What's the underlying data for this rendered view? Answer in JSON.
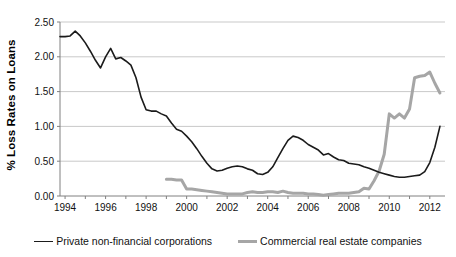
{
  "chart_data": {
    "type": "line",
    "title": "",
    "xlabel": "",
    "ylabel": "% Loss Rates on Loans",
    "xlim": [
      1993.75,
      2012.75
    ],
    "ylim": [
      0.0,
      2.5
    ],
    "grid": true,
    "grid_axis": "y",
    "legend_position": "bottom",
    "xticks": [
      1994,
      1996,
      1998,
      2000,
      2002,
      2004,
      2006,
      2008,
      2010,
      2012
    ],
    "xtick_labels": [
      "1994",
      "1996",
      "1998",
      "2000",
      "2002",
      "2004",
      "2006",
      "2008",
      "2010",
      "2012"
    ],
    "yticks": [
      0.0,
      0.5,
      1.0,
      1.5,
      2.0,
      2.5
    ],
    "ytick_labels": [
      "0.00",
      "0.50",
      "1.00",
      "1.50",
      "2.00",
      "2.50"
    ],
    "series": [
      {
        "name": "Private non-financial corporations",
        "color": "#1b1b1b",
        "width": 1.6,
        "x": [
          1993.75,
          1994.0,
          1994.25,
          1994.5,
          1994.75,
          1995.0,
          1995.25,
          1995.5,
          1995.75,
          1996.0,
          1996.25,
          1996.5,
          1996.75,
          1997.0,
          1997.25,
          1997.5,
          1997.75,
          1998.0,
          1998.25,
          1998.5,
          1998.75,
          1999.0,
          1999.25,
          1999.5,
          1999.75,
          2000.0,
          2000.25,
          2000.5,
          2000.75,
          2001.0,
          2001.25,
          2001.5,
          2001.75,
          2002.0,
          2002.25,
          2002.5,
          2002.75,
          2003.0,
          2003.25,
          2003.5,
          2003.75,
          2004.0,
          2004.25,
          2004.5,
          2004.75,
          2005.0,
          2005.25,
          2005.5,
          2005.75,
          2006.0,
          2006.25,
          2006.5,
          2006.75,
          2007.0,
          2007.25,
          2007.5,
          2007.75,
          2008.0,
          2008.25,
          2008.5,
          2008.75,
          2009.0,
          2009.25,
          2009.5,
          2009.75,
          2010.0,
          2010.25,
          2010.5,
          2010.75,
          2011.0,
          2011.25,
          2011.5,
          2011.75,
          2012.0,
          2012.25,
          2012.5
        ],
        "y": [
          2.29,
          2.29,
          2.3,
          2.37,
          2.3,
          2.2,
          2.08,
          1.95,
          1.84,
          2.0,
          2.12,
          1.97,
          1.99,
          1.94,
          1.88,
          1.7,
          1.42,
          1.24,
          1.22,
          1.22,
          1.18,
          1.15,
          1.05,
          0.96,
          0.93,
          0.86,
          0.78,
          0.68,
          0.57,
          0.47,
          0.39,
          0.36,
          0.37,
          0.4,
          0.42,
          0.43,
          0.42,
          0.39,
          0.37,
          0.32,
          0.31,
          0.34,
          0.42,
          0.55,
          0.68,
          0.8,
          0.86,
          0.84,
          0.8,
          0.74,
          0.7,
          0.66,
          0.59,
          0.61,
          0.56,
          0.52,
          0.51,
          0.47,
          0.46,
          0.45,
          0.42,
          0.4,
          0.37,
          0.34,
          0.32,
          0.3,
          0.28,
          0.27,
          0.27,
          0.28,
          0.29,
          0.3,
          0.35,
          0.48,
          0.7,
          1.0
        ],
        "y_extra": []
      },
      {
        "name": "Commercial real estate companies",
        "color": "#a6a6a6",
        "width": 3.0,
        "x": [
          1999.0,
          1999.25,
          1999.5,
          1999.75,
          2000.0,
          2000.25,
          2000.5,
          2000.75,
          2001.0,
          2001.25,
          2001.5,
          2001.75,
          2002.0,
          2002.25,
          2002.5,
          2002.75,
          2003.0,
          2003.25,
          2003.5,
          2003.75,
          2004.0,
          2004.25,
          2004.5,
          2004.75,
          2005.0,
          2005.25,
          2005.5,
          2005.75,
          2006.0,
          2006.25,
          2006.5,
          2006.75,
          2007.0,
          2007.25,
          2007.5,
          2007.75,
          2008.0,
          2008.25,
          2008.5,
          2008.75,
          2009.0,
          2009.25,
          2009.5,
          2009.75,
          2010.0,
          2010.25,
          2010.5,
          2010.75,
          2011.0,
          2011.25,
          2011.5,
          2011.75,
          2012.0,
          2012.25,
          2012.5
        ],
        "y": [
          0.24,
          0.24,
          0.23,
          0.23,
          0.1,
          0.1,
          0.09,
          0.08,
          0.07,
          0.06,
          0.05,
          0.04,
          0.03,
          0.03,
          0.03,
          0.03,
          0.05,
          0.06,
          0.05,
          0.05,
          0.06,
          0.06,
          0.05,
          0.07,
          0.05,
          0.04,
          0.04,
          0.04,
          0.03,
          0.03,
          0.02,
          0.01,
          0.02,
          0.03,
          0.04,
          0.04,
          0.04,
          0.05,
          0.06,
          0.11,
          0.1,
          0.22,
          0.36,
          0.6,
          1.18,
          1.12,
          1.18,
          1.12,
          1.25,
          1.7,
          1.72,
          1.73,
          1.78,
          1.62,
          1.48
        ]
      }
    ],
    "annotations": []
  },
  "legend": {
    "entries": [
      {
        "label": "Private non-financial corporations"
      },
      {
        "label": "Commercial real estate companies"
      }
    ]
  }
}
